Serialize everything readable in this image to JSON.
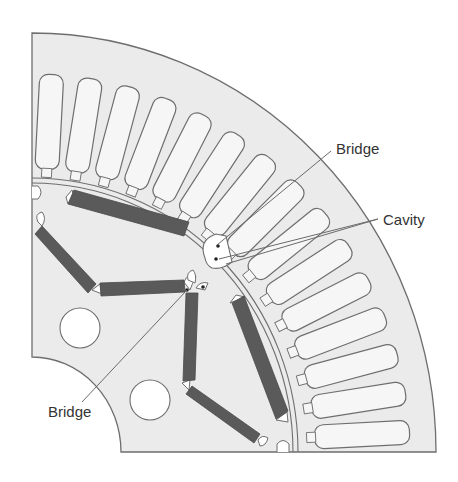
{
  "figure": {
    "colors": {
      "steel_fill": "#ebebeb",
      "outline": "#6e6e6e",
      "magnet_fill": "#5a5a5a",
      "slot_fill": "#f6f6f6",
      "hole_fill": "#ffffff",
      "leader_line": "#6a6a6a",
      "label_text": "#333333"
    },
    "stator_slot_count": 15,
    "rotor_cooling_holes": 2
  },
  "labels": {
    "bridge_top": "Bridge",
    "cavity": "Cavity",
    "bridge_bottom": "Bridge"
  }
}
